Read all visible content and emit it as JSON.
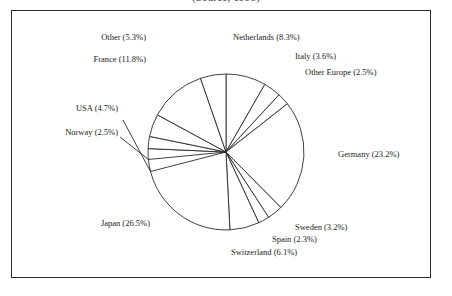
{
  "chart_title": "(Source, 1998)",
  "frame": {
    "border_color": "#2a2a2a"
  },
  "chart_data": {
    "type": "pie",
    "title": "(Source, 1998)",
    "xlabel": "",
    "ylabel": "",
    "legend_position": "none",
    "grid": false,
    "units": "percent",
    "start_angle_deg": 0,
    "direction": "clockwise",
    "categories": [
      "Netherlands",
      "Italy",
      "Other Europe",
      "Germany",
      "Sweden",
      "Spain",
      "Switzerland",
      "Japan",
      "Norway",
      "USA",
      "France",
      "Other"
    ],
    "values": [
      8.3,
      3.6,
      2.5,
      23.2,
      3.2,
      2.3,
      6.1,
      26.5,
      2.5,
      4.7,
      11.8,
      5.3
    ],
    "labels": [
      "Netherlands (8.3%)",
      "Italy (3.6%)",
      "Other Europe (2.5%)",
      "Germany (23.2%)",
      "Sweden (3.2%)",
      "Spain (2.3%)",
      "Switzerland (6.1%)",
      "Japan (26.5%)",
      "Norway (2.5%)",
      "USA (4.7%)",
      "France (11.8%)",
      "Other (5.3%)"
    ],
    "slice_fill": "#ffffff",
    "slice_stroke": "#2a2a2a"
  },
  "slice_labels": {
    "netherlands": "Netherlands (8.3%)",
    "italy": "Italy (3.6%)",
    "other_europe": "Other Europe (2.5%)",
    "germany": "Germany (23.2%)",
    "sweden": "Sweden (3.2%)",
    "spain": "Spain (2.3%)",
    "switzerland": "Switzerland (6.1%)",
    "japan": "Japan (26.5%)",
    "norway": "Norway (2.5%)",
    "usa": "USA (4.7%)",
    "france": "France (11.8%)",
    "other": "Other (5.3%)"
  }
}
